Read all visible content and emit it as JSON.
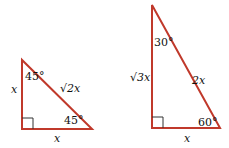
{
  "diagram": {
    "stroke_color": "#c0392b",
    "right_angle_marker_color": "#333333",
    "triangles": [
      {
        "name": "45-45-90",
        "angle_top": "45°",
        "angle_bottom_right": "45°",
        "leg_vertical": "x",
        "leg_horizontal": "x",
        "hypotenuse": "√2x"
      },
      {
        "name": "30-60-90",
        "angle_top": "30°",
        "angle_bottom_right": "60°",
        "leg_vertical": "√3x",
        "leg_horizontal": "x",
        "hypotenuse": "2x"
      }
    ]
  }
}
